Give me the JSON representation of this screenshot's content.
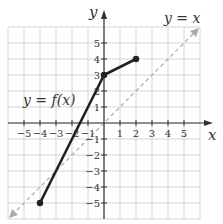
{
  "chart_data": {
    "type": "line",
    "title": "",
    "xlabel": "x",
    "ylabel": "y",
    "xlim": [
      -5,
      5
    ],
    "ylim": [
      -5,
      5
    ],
    "grid": true,
    "x_ticks": [
      -5,
      -4,
      -3,
      -2,
      -1,
      1,
      2,
      3,
      4,
      5
    ],
    "y_ticks": [
      5,
      4,
      3,
      2,
      1,
      -1,
      -2,
      -3,
      -4,
      -5
    ],
    "x_tick_labels": [
      "−5",
      "−4",
      "−3",
      "−2",
      "−1",
      "1",
      "2",
      "3",
      "4",
      "5"
    ],
    "y_tick_labels": [
      "5",
      "4",
      "3",
      "2",
      "1",
      "−1",
      "−2",
      "−3",
      "−4",
      "−5"
    ],
    "series": [
      {
        "name": "y = f(x)",
        "style": "solid",
        "color": "#222222",
        "points": [
          [
            -4,
            -5
          ],
          [
            0,
            3
          ],
          [
            2,
            4
          ]
        ],
        "endpoints_marked": [
          [
            -4,
            -5
          ],
          [
            0,
            3
          ],
          [
            2,
            4
          ]
        ]
      },
      {
        "name": "y = x",
        "style": "dashed",
        "color": "#aaaaaa",
        "points": [
          [
            -6,
            -6
          ],
          [
            6,
            6
          ]
        ],
        "arrows": "both"
      }
    ],
    "annotations": [
      {
        "text": "y = f(x)",
        "near": [
          -3.5,
          2.5
        ]
      },
      {
        "text": "y = x",
        "near": [
          5.5,
          7.5
        ]
      }
    ]
  },
  "labels": {
    "x_axis": "x",
    "y_axis": "y",
    "f_label": "y = f(x)",
    "identity_label": "y = x"
  }
}
